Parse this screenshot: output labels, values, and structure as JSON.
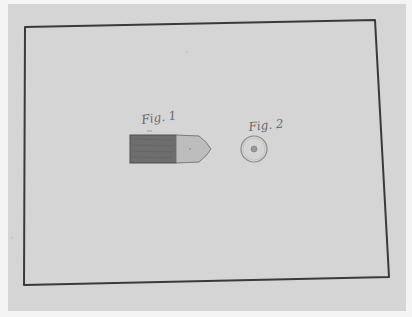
{
  "document": {
    "type": "patent drawing sheet",
    "figures": [
      {
        "id": "fig1",
        "label": "Fig. 1",
        "subject": "projectile side view"
      },
      {
        "id": "fig2",
        "label": "Fig. 2",
        "subject": "projectile end view"
      }
    ]
  },
  "colors": {
    "paper": "#d5d5d5",
    "margin": "#f4f4f4",
    "border_line": "#3a3a3a",
    "projectile_body": "#6e6e6e",
    "projectile_nose": "#bdbdbd",
    "label_ink": "#6a6a6a"
  }
}
